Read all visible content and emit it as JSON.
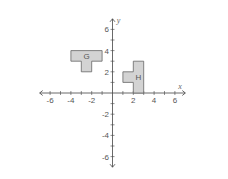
{
  "diagram": {
    "type": "coordinate-plane",
    "axes": {
      "x_label": "x",
      "y_label": "y",
      "x_range": [
        -7,
        7
      ],
      "y_range": [
        -7,
        7
      ],
      "x_tick_labels": [
        "-6",
        "-4",
        "-2",
        "2",
        "4",
        "6"
      ],
      "y_tick_labels": [
        "6",
        "4",
        "2",
        "-2",
        "-4",
        "-6"
      ]
    },
    "shapes": [
      {
        "label": "G",
        "fill": "#d3d3d3",
        "stroke": "#666666",
        "vertices": [
          [
            -4,
            4
          ],
          [
            -1,
            4
          ],
          [
            -1,
            3
          ],
          [
            -2,
            3
          ],
          [
            -2,
            2
          ],
          [
            -3,
            2
          ],
          [
            -3,
            3
          ],
          [
            -4,
            3
          ]
        ]
      },
      {
        "label": "H",
        "fill": "#d3d3d3",
        "stroke": "#666666",
        "vertices": [
          [
            2,
            3
          ],
          [
            3,
            3
          ],
          [
            3,
            0
          ],
          [
            2,
            0
          ],
          [
            2,
            1
          ],
          [
            1,
            1
          ],
          [
            1,
            2
          ],
          [
            2,
            2
          ]
        ]
      }
    ],
    "colors": {
      "axis": "#444444",
      "shape_fill": "#d3d3d3",
      "shape_stroke": "#666666"
    }
  }
}
